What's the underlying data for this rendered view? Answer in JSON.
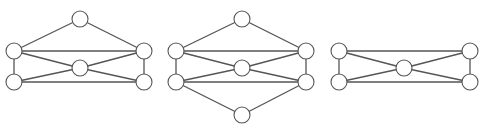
{
  "diagram": {
    "type": "graph",
    "title": "",
    "style": {
      "edge_color": "#555555",
      "node_fill": "#ffffff",
      "node_stroke": "#555555",
      "node_radius": 8,
      "background": "#ffffff"
    },
    "graphs": [
      {
        "id": "graph-1",
        "nodes": [
          {
            "id": "top",
            "x": 80,
            "y": 19
          },
          {
            "id": "upper-left",
            "x": 14,
            "y": 51
          },
          {
            "id": "upper-right",
            "x": 144,
            "y": 51
          },
          {
            "id": "center",
            "x": 80,
            "y": 68
          },
          {
            "id": "lower-left",
            "x": 14,
            "y": 82
          },
          {
            "id": "lower-right",
            "x": 144,
            "y": 82
          }
        ],
        "edges": [
          [
            "top",
            "upper-left"
          ],
          [
            "top",
            "upper-right"
          ],
          [
            "upper-left",
            "upper-right"
          ],
          [
            "upper-left",
            "lower-left"
          ],
          [
            "upper-right",
            "lower-right"
          ],
          [
            "upper-left",
            "center"
          ],
          [
            "upper-right",
            "center"
          ],
          [
            "lower-left",
            "center"
          ],
          [
            "lower-right",
            "center"
          ],
          [
            "lower-left",
            "lower-right"
          ]
        ]
      },
      {
        "id": "graph-2",
        "nodes": [
          {
            "id": "top",
            "x": 242,
            "y": 19
          },
          {
            "id": "upper-left",
            "x": 176,
            "y": 51
          },
          {
            "id": "upper-right",
            "x": 306,
            "y": 51
          },
          {
            "id": "center",
            "x": 242,
            "y": 68
          },
          {
            "id": "lower-left",
            "x": 176,
            "y": 82
          },
          {
            "id": "lower-right",
            "x": 306,
            "y": 82
          },
          {
            "id": "bottom",
            "x": 242,
            "y": 115
          }
        ],
        "edges": [
          [
            "top",
            "upper-left"
          ],
          [
            "top",
            "upper-right"
          ],
          [
            "upper-left",
            "upper-right"
          ],
          [
            "upper-left",
            "lower-left"
          ],
          [
            "upper-right",
            "lower-right"
          ],
          [
            "upper-left",
            "center"
          ],
          [
            "upper-right",
            "center"
          ],
          [
            "lower-left",
            "center"
          ],
          [
            "lower-right",
            "center"
          ],
          [
            "lower-left",
            "lower-right"
          ],
          [
            "lower-left",
            "bottom"
          ],
          [
            "lower-right",
            "bottom"
          ]
        ]
      },
      {
        "id": "graph-3",
        "nodes": [
          {
            "id": "upper-left",
            "x": 339,
            "y": 51
          },
          {
            "id": "upper-right",
            "x": 470,
            "y": 51
          },
          {
            "id": "center",
            "x": 404,
            "y": 68
          },
          {
            "id": "lower-left",
            "x": 339,
            "y": 82
          },
          {
            "id": "lower-right",
            "x": 470,
            "y": 82
          }
        ],
        "edges": [
          [
            "upper-left",
            "upper-right"
          ],
          [
            "upper-left",
            "lower-left"
          ],
          [
            "upper-right",
            "lower-right"
          ],
          [
            "upper-left",
            "center"
          ],
          [
            "upper-right",
            "center"
          ],
          [
            "lower-left",
            "center"
          ],
          [
            "lower-right",
            "center"
          ],
          [
            "lower-left",
            "lower-right"
          ]
        ]
      }
    ]
  }
}
